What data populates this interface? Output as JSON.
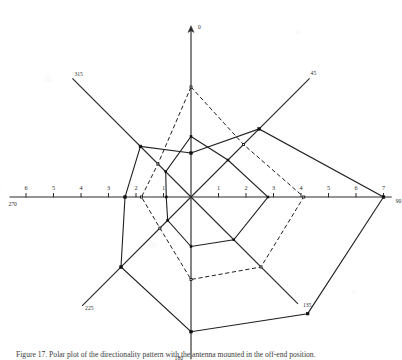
{
  "figure": {
    "caption": "Figure 17. Polar plot of the directionality pattern with the antenna mounted in the off-end position."
  },
  "chart_data": {
    "type": "line",
    "subtype": "polar-radar",
    "xlabel": "",
    "ylabel": "",
    "grid": false,
    "legend_position": "none",
    "center": {
      "x": 191,
      "y": 197
    },
    "pixels_per_unit": 27.5,
    "radial_range": [
      0,
      7
    ],
    "angles_deg": [
      0,
      45,
      90,
      135,
      180,
      225,
      270,
      315
    ],
    "angle_labels": [
      "0",
      "45",
      "90",
      "135",
      "180",
      "225",
      "270",
      "315"
    ],
    "horizontal_axis": {
      "left_ticks": [
        "7",
        "6",
        "5",
        "4",
        "3",
        "2",
        "1"
      ],
      "right_ticks": [
        "1",
        "2",
        "3",
        "4",
        "5",
        "6",
        "7"
      ],
      "left_end_label": "270",
      "right_end_label": "90"
    },
    "vertical_axis": {
      "top_end_label": "0",
      "bottom_end_label": "180",
      "has_arrow_head": true
    },
    "series": [
      {
        "name": "solid-curve",
        "style": "solid",
        "marker": "filled-square",
        "values": [
          1.6,
          3.5,
          7.0,
          6.0,
          4.9,
          3.6,
          2.4,
          2.6
        ]
      },
      {
        "name": "dashed-curve",
        "style": "dashed",
        "marker": "open-square",
        "values": [
          4.0,
          2.7,
          4.1,
          3.6,
          3.0,
          1.6,
          1.8,
          1.7
        ]
      },
      {
        "name": "inner-solid-curve",
        "style": "solid",
        "marker": "small-square",
        "values": [
          2.2,
          1.9,
          2.8,
          2.2,
          1.8,
          1.2,
          0.9,
          1.3
        ]
      }
    ],
    "colors": {
      "axis": "#2b2b2b",
      "solid_series": "#1f1f1f",
      "dashed_series": "#1f1f1f",
      "background": "#ffffff"
    }
  }
}
